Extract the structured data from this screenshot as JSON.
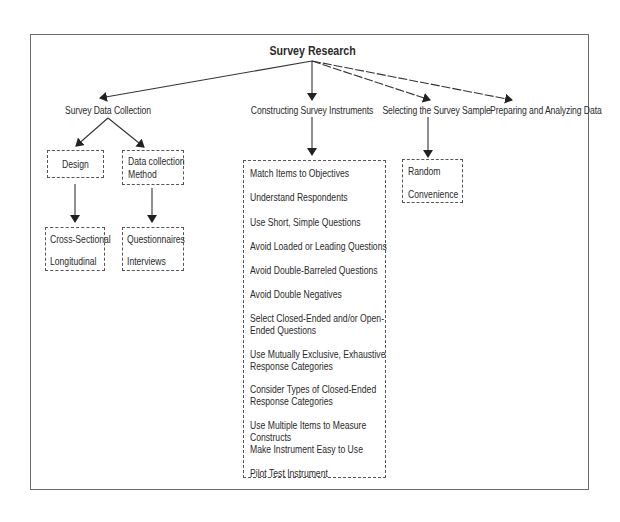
{
  "diagram": {
    "title": "Survey Research",
    "branches": [
      {
        "label": "Survey Data Collection",
        "children": [
          {
            "label": "Design",
            "children": [
              "Cross-Sectional",
              "Longitudinal"
            ]
          },
          {
            "label": "Data collection Method",
            "label_lines": [
              "Data collection",
              "Method"
            ],
            "children": [
              "Questionnaires",
              "Interviews"
            ]
          }
        ]
      },
      {
        "label": "Constructing Survey Instruments",
        "items": [
          "Match Items to Objectives",
          "Understand Respondents",
          "Use Short, Simple Questions",
          "Avoid Loaded or Leading Questions",
          "Avoid Double-Barreled Questions",
          "Avoid Double Negatives",
          "Select Closed-Ended and/or Open-Ended Questions",
          "Use Mutually Exclusive, Exhaustive Response Categories",
          "Consider Types of Closed-Ended Response Categories",
          "Use Multiple Items to Measure Constructs",
          "Make Instrument Easy to Use",
          "Pilot Test Instrument"
        ]
      },
      {
        "label": "Selecting the Survey Sample",
        "items": [
          "Random",
          "Convenience"
        ]
      },
      {
        "label": "Preparing and Analyzing Data"
      }
    ]
  },
  "colors": {
    "line": "#333333",
    "frame": "#6a6a6a",
    "text": "#2a2a2a"
  }
}
